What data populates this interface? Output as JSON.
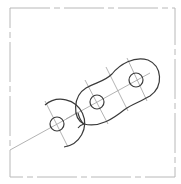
{
  "drawing": {
    "type": "mechanical-link-sketch",
    "frame": {
      "x": 10,
      "y": 8,
      "width": 165,
      "height": 169,
      "stroke": "#b8b8b8"
    },
    "colors": {
      "outline": "#3a3a3a",
      "construction": "#a0a0a0",
      "frame": "#b8b8b8",
      "background": "#ffffff"
    },
    "holes": [
      {
        "id": "left",
        "cx": 57,
        "cy": 124,
        "r": 7
      },
      {
        "id": "middle",
        "cx": 97,
        "cy": 102,
        "r": 7
      },
      {
        "id": "right",
        "cx": 136,
        "cy": 80,
        "r": 7
      }
    ],
    "left_arc": {
      "cx": 57,
      "cy": 124,
      "r": 24
    },
    "centerline": {
      "x1": 10,
      "y1": 150,
      "x2": 150,
      "y2": 73
    }
  }
}
